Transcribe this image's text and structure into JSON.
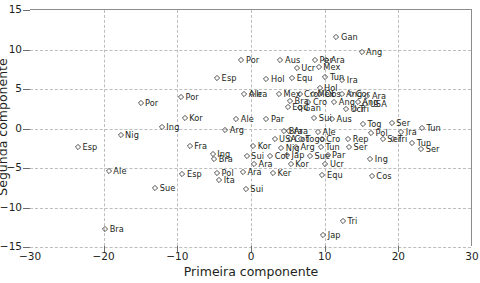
{
  "chart_data": {
    "type": "scatter",
    "title": "",
    "xlabel": "Primeira componente",
    "ylabel": "Segunda componente",
    "xlim": [
      -30,
      30
    ],
    "ylim": [
      -15,
      15
    ],
    "xticks": [
      -30,
      -20,
      -10,
      0,
      10,
      20,
      30
    ],
    "yticks": [
      15,
      10,
      5,
      0,
      -5,
      -10,
      -15
    ],
    "grid": true,
    "legend": "none",
    "marker": "open-diamond",
    "marker_color": "#3b3b3b",
    "points": [
      {
        "label": "Gan",
        "x": 11.6,
        "y": 11.4
      },
      {
        "label": "Ang",
        "x": 15.0,
        "y": 9.5
      },
      {
        "label": "Aus",
        "x": 4.0,
        "y": 8.6
      },
      {
        "label": "Por",
        "x": -1.3,
        "y": 8.5
      },
      {
        "label": "Ucr",
        "x": 6.2,
        "y": 7.5
      },
      {
        "label": "Mex",
        "x": 9.2,
        "y": 7.6
      },
      {
        "label": "Ara",
        "x": 10.2,
        "y": 8.6
      },
      {
        "label": "Per",
        "x": 8.7,
        "y": 8.6
      },
      {
        "label": "Hol",
        "x": 2.1,
        "y": 6.2
      },
      {
        "label": "Equ",
        "x": 5.6,
        "y": 6.3
      },
      {
        "label": "Tun",
        "x": 10.1,
        "y": 6.4
      },
      {
        "label": "Ira",
        "x": 12.4,
        "y": 6.0
      },
      {
        "label": "Esp",
        "x": -4.6,
        "y": 6.3
      },
      {
        "label": "Por",
        "x": -9.5,
        "y": 3.8
      },
      {
        "label": "Hol",
        "x": 9.3,
        "y": 5.0
      },
      {
        "label": "Ira",
        "x": 0.1,
        "y": 4.3
      },
      {
        "label": "Ale",
        "x": -0.9,
        "y": 4.3
      },
      {
        "label": "Mex",
        "x": 3.8,
        "y": 4.2
      },
      {
        "label": "Cro",
        "x": 6.6,
        "y": 4.2
      },
      {
        "label": "Mex",
        "x": 8.4,
        "y": 4.3
      },
      {
        "label": "Obs",
        "x": 9.4,
        "y": 4.2
      },
      {
        "label": "Ang",
        "x": 12.3,
        "y": 4.3
      },
      {
        "label": "Cor",
        "x": 13.6,
        "y": 4.3
      },
      {
        "label": "Ara",
        "x": 15.8,
        "y": 4.0
      },
      {
        "label": "Bra",
        "x": 5.3,
        "y": 3.4
      },
      {
        "label": "Cro",
        "x": 7.8,
        "y": 3.2
      },
      {
        "label": "Ang",
        "x": 11.3,
        "y": 3.2
      },
      {
        "label": "Ang",
        "x": 14.5,
        "y": 3.2
      },
      {
        "label": "USA",
        "x": 15.5,
        "y": 3.0
      },
      {
        "label": "Equ",
        "x": 5.0,
        "y": 2.6
      },
      {
        "label": "Gan",
        "x": 6.6,
        "y": 2.5
      },
      {
        "label": "Ucr",
        "x": 12.9,
        "y": 2.4
      },
      {
        "label": "Tri",
        "x": 14.1,
        "y": 2.4
      },
      {
        "label": "Por",
        "x": -15.0,
        "y": 3.1
      },
      {
        "label": "Kor",
        "x": -9.0,
        "y": 1.2
      },
      {
        "label": "Ale",
        "x": -2.0,
        "y": 1.1
      },
      {
        "label": "Par",
        "x": 2.1,
        "y": 1.1
      },
      {
        "label": "Sui",
        "x": 8.6,
        "y": 1.2
      },
      {
        "label": "Aus",
        "x": 11.0,
        "y": 1.1
      },
      {
        "label": "Tog",
        "x": 15.2,
        "y": 0.5
      },
      {
        "label": "Ser",
        "x": 19.1,
        "y": 0.6
      },
      {
        "label": "Ing",
        "x": -12.1,
        "y": 0.1
      },
      {
        "label": "Arg",
        "x": -3.5,
        "y": -0.3
      },
      {
        "label": "Bra",
        "x": 4.5,
        "y": -0.5
      },
      {
        "label": "Ara",
        "x": 5.2,
        "y": -0.5
      },
      {
        "label": "Ale",
        "x": 9.1,
        "y": -0.6
      },
      {
        "label": "Pol",
        "x": 16.3,
        "y": -0.7
      },
      {
        "label": "Ira",
        "x": 20.4,
        "y": -0.6
      },
      {
        "label": "Tun",
        "x": 23.2,
        "y": -0.1
      },
      {
        "label": "Nig",
        "x": -17.7,
        "y": -1.0
      },
      {
        "label": "USA",
        "x": 3.2,
        "y": -1.5
      },
      {
        "label": "Cot",
        "x": 5.3,
        "y": -1.4
      },
      {
        "label": "Togo",
        "x": 6.8,
        "y": -1.5
      },
      {
        "label": "Cro",
        "x": 9.6,
        "y": -1.5
      },
      {
        "label": "Rep",
        "x": 13.2,
        "y": -1.5
      },
      {
        "label": "Ser",
        "x": 17.9,
        "y": -1.5
      },
      {
        "label": "Tri",
        "x": 19.3,
        "y": -1.4
      },
      {
        "label": "Esp",
        "x": -23.5,
        "y": -2.5
      },
      {
        "label": "Fra",
        "x": -8.3,
        "y": -2.4
      },
      {
        "label": "Nig",
        "x": 4.1,
        "y": -2.6
      },
      {
        "label": "Kor",
        "x": 0.3,
        "y": -2.4
      },
      {
        "label": "Arg",
        "x": 6.1,
        "y": -2.5
      },
      {
        "label": "Tun",
        "x": 9.5,
        "y": -2.5
      },
      {
        "label": "Ser",
        "x": 13.3,
        "y": -2.5
      },
      {
        "label": "Tun",
        "x": 21.9,
        "y": -2.0
      },
      {
        "label": "Ser",
        "x": 23.1,
        "y": -2.7
      },
      {
        "label": "Ing",
        "x": -5.2,
        "y": -3.3
      },
      {
        "label": "Bra",
        "x": -5.0,
        "y": -4.0
      },
      {
        "label": "Sui",
        "x": -0.6,
        "y": -3.6
      },
      {
        "label": "Cot",
        "x": 2.6,
        "y": -3.6
      },
      {
        "label": "Jap",
        "x": 4.9,
        "y": -3.5
      },
      {
        "label": "Sue",
        "x": 8.0,
        "y": -3.6
      },
      {
        "label": "Par",
        "x": 10.4,
        "y": -3.5
      },
      {
        "label": "Ara",
        "x": 0.4,
        "y": -4.6
      },
      {
        "label": "Kor",
        "x": 5.4,
        "y": -4.6
      },
      {
        "label": "Ucr",
        "x": 10.1,
        "y": -4.6
      },
      {
        "label": "Ing",
        "x": 16.2,
        "y": -4.0
      },
      {
        "label": "Ale",
        "x": -19.3,
        "y": -5.5
      },
      {
        "label": "Esp",
        "x": -9.3,
        "y": -5.9
      },
      {
        "label": "Pol",
        "x": -4.6,
        "y": -5.7
      },
      {
        "label": "Ita",
        "x": -4.3,
        "y": -6.7
      },
      {
        "label": "Ara",
        "x": -1.1,
        "y": -5.6
      },
      {
        "label": "Ker",
        "x": 3.0,
        "y": -5.7
      },
      {
        "label": "Equ",
        "x": 9.7,
        "y": -6.0
      },
      {
        "label": "Cos",
        "x": 16.4,
        "y": -6.2
      },
      {
        "label": "Sue",
        "x": -13.0,
        "y": -7.6
      },
      {
        "label": "Sui",
        "x": -0.7,
        "y": -7.8
      },
      {
        "label": "Tri",
        "x": 12.5,
        "y": -11.8
      },
      {
        "label": "Bra",
        "x": -19.8,
        "y": -12.9
      },
      {
        "label": "Jap",
        "x": 9.8,
        "y": -13.6
      }
    ]
  }
}
